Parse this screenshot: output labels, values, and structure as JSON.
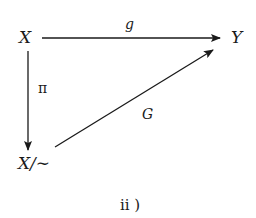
{
  "diagram": {
    "type": "commutative-diagram",
    "nodes": {
      "top_left": "X",
      "top_right": "Y",
      "bottom_left": "X/∼"
    },
    "arrows": [
      {
        "id": "g",
        "from": "X",
        "to": "Y",
        "label": "g",
        "direction": "horizontal"
      },
      {
        "id": "pi",
        "from": "X",
        "to": "X/∼",
        "label": "π",
        "direction": "vertical"
      },
      {
        "id": "G",
        "from": "X/∼",
        "to": "Y",
        "label": "G",
        "direction": "diagonal"
      }
    ],
    "caption": "ii )"
  },
  "colors": {
    "ink": "#1a1a1a",
    "background": "#ffffff"
  }
}
